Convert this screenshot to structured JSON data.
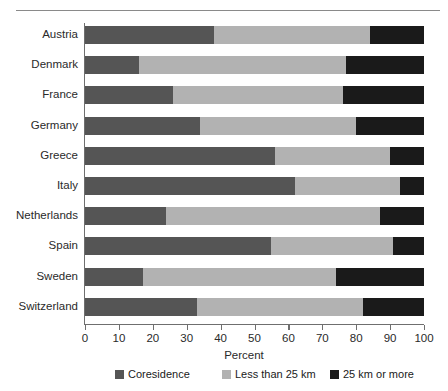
{
  "chart_data": {
    "type": "bar",
    "orientation": "horizontal",
    "stacked": true,
    "stack_mode": "percent",
    "title": "",
    "xlabel": "Percent",
    "ylabel": "",
    "xlim": [
      0,
      100
    ],
    "xticks": [
      0,
      10,
      20,
      30,
      40,
      50,
      60,
      70,
      80,
      90,
      100
    ],
    "xtick_labels": [
      "0",
      "10",
      "20",
      "30",
      "40",
      "50",
      "60",
      "70",
      "80",
      "90",
      "100"
    ],
    "grid": false,
    "legend_position": "bottom",
    "categories": [
      "Austria",
      "Denmark",
      "France",
      "Germany",
      "Greece",
      "Italy",
      "Netherlands",
      "Spain",
      "Sweden",
      "Switzerland"
    ],
    "series": [
      {
        "name": "Coresidence",
        "color": "#555555",
        "values": [
          38,
          16,
          26,
          34,
          56,
          62,
          24,
          55,
          17,
          33
        ]
      },
      {
        "name": "Less than 25 km",
        "color": "#b2b2b2",
        "values": [
          46,
          61,
          50,
          46,
          34,
          31,
          63,
          36,
          57,
          49
        ]
      },
      {
        "name": "25 km or more",
        "color": "#1a1a1a",
        "values": [
          16,
          23,
          24,
          20,
          10,
          7,
          13,
          9,
          26,
          18
        ]
      }
    ]
  },
  "legend": {
    "items": [
      {
        "label": "Coresidence",
        "color": "#555555"
      },
      {
        "label": "Less than 25 km",
        "color": "#b2b2b2"
      },
      {
        "label": "25 km or more",
        "color": "#1a1a1a"
      }
    ]
  },
  "axis": {
    "x_title": "Percent"
  }
}
